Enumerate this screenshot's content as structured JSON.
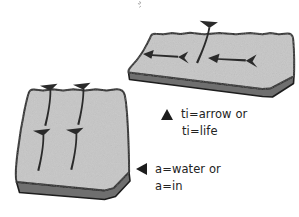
{
  "figure": {
    "colors": {
      "tablet_face": "#c6c6c6",
      "tablet_edge": "#8a8a8a",
      "tablet_edge_dark": "#6f6f6f",
      "outline": "#1d1d1d",
      "glyph": "#2a2a2a",
      "background": "#ffffff",
      "text": "#232323"
    },
    "tablets": [
      {
        "name": "upper-right-tablet",
        "glyph_count": 3,
        "glyphs": [
          {
            "name": "horizontal-arrow-sign-left",
            "orientation": "horizontal"
          },
          {
            "name": "vertical-arrow-sign",
            "orientation": "vertical"
          },
          {
            "name": "horizontal-arrow-sign-right",
            "orientation": "horizontal"
          }
        ]
      },
      {
        "name": "lower-left-tablet",
        "glyph_count": 4,
        "glyphs": [
          {
            "name": "vertical-arrow-sign-top-left",
            "orientation": "vertical"
          },
          {
            "name": "vertical-arrow-sign-top-right",
            "orientation": "vertical"
          },
          {
            "name": "vertical-arrow-sign-bottom-left",
            "orientation": "vertical"
          },
          {
            "name": "vertical-arrow-sign-bottom-right",
            "orientation": "vertical"
          }
        ]
      }
    ]
  },
  "legend": {
    "entries": [
      {
        "bullet_icon": "triangle-up-icon",
        "bullet_direction": "up",
        "line1": "ti=arrow or",
        "line2": "ti=life"
      },
      {
        "bullet_icon": "triangle-left-icon",
        "bullet_direction": "left",
        "line1": "a=water or",
        "line2": "a=in"
      }
    ]
  }
}
